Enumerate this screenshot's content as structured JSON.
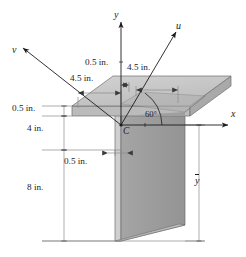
{
  "figure": {
    "background_color": "#ffffff",
    "solid_fill_top": "#c9c9c9",
    "solid_fill_front": "#a8a8a8",
    "solid_fill_web": "#9b9b9b",
    "line_color": "#1c1c1c",
    "dimension_line_color": "#8a8a8a"
  },
  "axes": [
    {
      "id": "y-axis",
      "label": "y",
      "description": "vertical axis pointing up from centroid"
    },
    {
      "id": "x-axis",
      "label": "x",
      "description": "horizontal axis pointing right from centroid"
    },
    {
      "id": "u-axis",
      "label": "u",
      "description": "inclined axis up-right at 60 degrees from x"
    },
    {
      "id": "v-axis",
      "label": "v",
      "description": "inclined axis up-left perpendicular to u"
    }
  ],
  "centroid": {
    "label": "C",
    "description": "centroid of the cross section"
  },
  "angle": {
    "label": "60°",
    "value": 60,
    "unit": "degrees",
    "between": [
      "x-axis",
      "u-axis"
    ]
  },
  "dimensions": [
    {
      "id": "flange-right-half",
      "label": "0.5 in.",
      "value": 0.5,
      "unit": "in."
    },
    {
      "id": "flange-left-overhang",
      "label": "4.5 in.",
      "value": 4.5,
      "unit": "in."
    },
    {
      "id": "flange-right-overhang",
      "label": "4.5 in.",
      "value": 4.5,
      "unit": "in."
    },
    {
      "id": "flange-thickness",
      "label": "0.5 in.",
      "value": 0.5,
      "unit": "in."
    },
    {
      "id": "upper-web-height",
      "label": "4 in.",
      "value": 4,
      "unit": "in."
    },
    {
      "id": "web-thickness",
      "label": "0.5 in.",
      "value": 0.5,
      "unit": "in."
    },
    {
      "id": "lower-web-height",
      "label": "8 in.",
      "value": 8,
      "unit": "in."
    }
  ],
  "centroid_distance": {
    "id": "y-bar",
    "label": "y",
    "overbar": true,
    "description": "distance from bottom of section to centroidal x-axis"
  }
}
